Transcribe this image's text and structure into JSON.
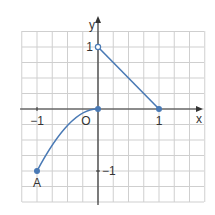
{
  "chart_data": {
    "type": "line",
    "title": "",
    "xlabel": "x",
    "ylabel": "y",
    "xlim": [
      -1.25,
      1.75
    ],
    "ylim": [
      -1.25,
      1.25
    ],
    "grid": true,
    "grid_step": 0.25,
    "x_ticks": [
      {
        "value": -1,
        "label": "−1"
      },
      {
        "value": 1,
        "label": "1"
      }
    ],
    "y_ticks": [
      {
        "value": 1,
        "label": "1"
      },
      {
        "value": -1,
        "label": "−1"
      }
    ],
    "origin_label": "O",
    "series": [
      {
        "name": "curve",
        "kind": "curve",
        "description": "concave arc from A(-1,-1) rising to origin (0,0), tangent horizontal at origin",
        "points": [
          [
            -1,
            -1
          ],
          [
            -0.75,
            -0.5625
          ],
          [
            -0.5,
            -0.25
          ],
          [
            -0.25,
            -0.0625
          ],
          [
            0,
            0
          ]
        ],
        "endpoints": [
          {
            "x": -1,
            "y": -1,
            "filled": true
          },
          {
            "x": 0,
            "y": 0,
            "filled": true
          }
        ]
      },
      {
        "name": "segment",
        "kind": "line",
        "points": [
          [
            0,
            1
          ],
          [
            1,
            0
          ]
        ],
        "endpoints": [
          {
            "x": 0,
            "y": 1,
            "filled": false
          },
          {
            "x": 1,
            "y": 0,
            "filled": true
          }
        ]
      }
    ],
    "annotations": [
      {
        "label": "A",
        "x": -1,
        "y": -1
      }
    ],
    "colors": {
      "line": "#4a7ab5",
      "grid": "#cfcfcf",
      "axis": "#333333"
    }
  }
}
